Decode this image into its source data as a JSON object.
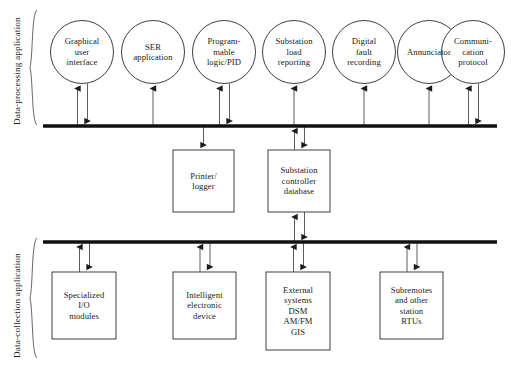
{
  "diagram": {
    "colors": {
      "stroke": "#2b2b2b",
      "bus": "#111111",
      "text": "#1a1a1a",
      "background": "#ffffff"
    },
    "side_labels": [
      {
        "name": "data-processing-application",
        "text": "Data-processing application"
      },
      {
        "name": "data-collection-application",
        "text": "Data-collection application"
      }
    ],
    "top_circles": [
      {
        "name": "graphical-user-interface",
        "lines": [
          "Graphical",
          "user",
          "interface"
        ],
        "cx": 82,
        "cy": 52,
        "r": 31.5,
        "arrows": "both"
      },
      {
        "name": "ser-application",
        "lines": [
          "SER",
          "application"
        ],
        "cx": 153,
        "cy": 52,
        "r": 31.5,
        "arrows": "up"
      },
      {
        "name": "programmable-logic-pid",
        "lines": [
          "Program-",
          "mable",
          "logic/PID"
        ],
        "cx": 224,
        "cy": 52,
        "r": 31.5,
        "arrows": "both"
      },
      {
        "name": "substation-load-reporting",
        "lines": [
          "Substation",
          "load",
          "reporting"
        ],
        "cx": 294,
        "cy": 52,
        "r": 31.5,
        "arrows": "up"
      },
      {
        "name": "digital-fault-recording",
        "lines": [
          "Digital",
          "fault",
          "recording"
        ],
        "cx": 364,
        "cy": 52,
        "r": 31.5,
        "arrows": "up"
      },
      {
        "name": "annunciator",
        "lines": [
          "Annunciator"
        ],
        "cx": 429,
        "cy": 52,
        "r": 31.5,
        "arrows": "up"
      },
      {
        "name": "communication-protocol",
        "lines": [
          "Communi-",
          "cation",
          "protocol"
        ],
        "cx": 473,
        "cy": 52,
        "r": 31.5,
        "arrows": "both"
      }
    ],
    "middle_boxes": [
      {
        "name": "printer-logger",
        "lines": [
          "Printer/",
          "logger"
        ],
        "x": 173,
        "y": 150,
        "w": 61,
        "h": 62,
        "arrows": "down"
      },
      {
        "name": "substation-controller-database",
        "lines": [
          "Substation",
          "controller",
          "database"
        ],
        "x": 268,
        "y": 150,
        "w": 62,
        "h": 62,
        "arrows": "both-top-both-bottom"
      }
    ],
    "bottom_boxes": [
      {
        "name": "specialized-io-modules",
        "lines": [
          "Specialized",
          "I/O",
          "modules"
        ],
        "x": 52,
        "y": 272,
        "w": 64,
        "h": 67,
        "arrows": "both"
      },
      {
        "name": "intelligent-electronic-device",
        "lines": [
          "Intelligent",
          "electronic",
          "device"
        ],
        "x": 173,
        "y": 272,
        "w": 63,
        "h": 67,
        "arrows": "both"
      },
      {
        "name": "external-systems",
        "lines": [
          "External",
          "systems",
          "DSM",
          "AM/FM",
          "GIS"
        ],
        "x": 266,
        "y": 272,
        "w": 64,
        "h": 78,
        "arrows": "both"
      },
      {
        "name": "subremotes-station-rtus",
        "lines": [
          "Subremotes",
          "and other",
          "station",
          "RTUs"
        ],
        "x": 380,
        "y": 272,
        "w": 63,
        "h": 67,
        "arrows": "both"
      }
    ],
    "buses": [
      {
        "name": "data-processing-bus",
        "x1": 43,
        "x2": 497,
        "y": 126
      },
      {
        "name": "data-collection-bus",
        "x1": 43,
        "x2": 497,
        "y": 242
      }
    ]
  }
}
